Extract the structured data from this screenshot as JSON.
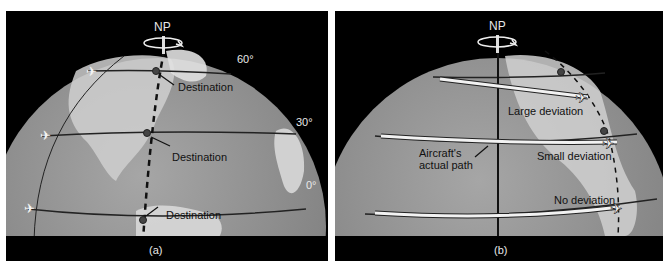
{
  "figure": {
    "panel_a": {
      "caption": "(a)",
      "pole_label": "NP",
      "latitude_labels": [
        "60°",
        "30°",
        "0°"
      ],
      "destination_labels": [
        "Destination",
        "Destination",
        "Destination"
      ]
    },
    "panel_b": {
      "caption": "(b)",
      "pole_label": "NP",
      "path_label_line1": "Aircraft's",
      "path_label_line2": "actual path",
      "deviation_labels": [
        "Large deviation",
        "Small deviation",
        "No deviation"
      ]
    }
  },
  "colors": {
    "background": "#000000",
    "globe_ocean": "#8a8a8a",
    "globe_land": "#d4d4d4",
    "line": "#222222",
    "path": "#f2f2f2"
  }
}
